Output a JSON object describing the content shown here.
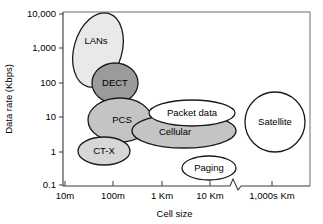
{
  "chart_data": {
    "type": "scatter",
    "title": "",
    "xlabel": "Cell size",
    "ylabel": "Data rate (Kbps)",
    "x_scale": "log",
    "y_scale": "log",
    "grid": false,
    "legend": "none",
    "axis_break": {
      "present": true,
      "between": [
        "10 Km",
        "1,000s Km"
      ],
      "marker": "zigzag"
    },
    "xticks": [
      {
        "label": "10m",
        "x": 65
      },
      {
        "label": "100m",
        "x": 113
      },
      {
        "label": "1 Km",
        "x": 162
      },
      {
        "label": "10 Km",
        "x": 210
      },
      {
        "label": "1,000s Km",
        "x": 272
      }
    ],
    "yticks": [
      {
        "label": "10,000",
        "y": 14
      },
      {
        "label": "1,000",
        "y": 48
      },
      {
        "label": "100",
        "y": 83
      },
      {
        "label": "10",
        "y": 117
      },
      {
        "label": "1",
        "y": 152
      },
      {
        "label": "0.1",
        "y": 185
      }
    ],
    "ylim": [
      0.1,
      10000
    ],
    "series": [
      {
        "name": "LANs",
        "label": "LANs",
        "shape": "ellipse",
        "cx": 98,
        "cy": 50,
        "rx": 24,
        "ry": 38,
        "rotation": 16,
        "fill": "#e9e9e9",
        "stroke": "#1a1a1a",
        "cell_size_range": "10m-100m",
        "data_rate_range": "100-10,000 Kbps"
      },
      {
        "name": "DECT",
        "label": "DECT",
        "shape": "ellipse",
        "cx": 115,
        "cy": 83,
        "rx": 23,
        "ry": 20,
        "rotation": 0,
        "fill": "#9b9b9b",
        "stroke": "#1a1a1a",
        "cell_size_range": "~100m",
        "data_rate_range": "~100 Kbps"
      },
      {
        "name": "PCS",
        "label": "PCS",
        "shape": "ellipse",
        "cx": 120,
        "cy": 120,
        "rx": 32,
        "ry": 22,
        "rotation": 0,
        "fill": "#c4c4c4",
        "stroke": "#1a1a1a",
        "cell_size_range": "100m-1 Km",
        "data_rate_range": "~10 Kbps"
      },
      {
        "name": "CT-X",
        "label": "CT-X",
        "shape": "ellipse",
        "cx": 104,
        "cy": 151,
        "rx": 26,
        "ry": 14,
        "rotation": 0,
        "fill": "#d7d7d7",
        "stroke": "#1a1a1a",
        "cell_size_range": "50m-300m",
        "data_rate_range": "~1 Kbps"
      },
      {
        "name": "Cellular",
        "label": "Cellular",
        "shape": "ellipse",
        "cx": 184,
        "cy": 131,
        "rx": 52,
        "ry": 17,
        "rotation": 0,
        "fill": "#c4c4c4",
        "stroke": "#1a1a1a",
        "cell_size_range": "500m-10 Km",
        "data_rate_range": "~3-10 Kbps"
      },
      {
        "name": "Packet data",
        "label": "Packet data",
        "shape": "ellipse",
        "cx": 192,
        "cy": 113,
        "rx": 43,
        "ry": 13,
        "rotation": 0,
        "fill": "#ffffff",
        "stroke": "#1a1a1a",
        "cell_size_range": "1-10 Km",
        "data_rate_range": "~10 Kbps"
      },
      {
        "name": "Paging",
        "label": "Paging",
        "shape": "ellipse",
        "cx": 209,
        "cy": 168,
        "rx": 27,
        "ry": 12,
        "rotation": 0,
        "fill": "#ffffff",
        "stroke": "#1a1a1a",
        "cell_size_range": "5-20 Km",
        "data_rate_range": "~0.3 Kbps"
      },
      {
        "name": "Satellite",
        "label": "Satellite",
        "shape": "circle",
        "cx": 275,
        "cy": 122,
        "rx": 30,
        "ry": 30,
        "rotation": 0,
        "fill": "#ffffff",
        "stroke": "#1a1a1a",
        "cell_size_range": "1,000s Km",
        "data_rate_range": "~5 Kbps"
      }
    ]
  },
  "plot": {
    "frame": {
      "left": 63,
      "top": 12,
      "right": 310,
      "bottom": 186
    }
  }
}
